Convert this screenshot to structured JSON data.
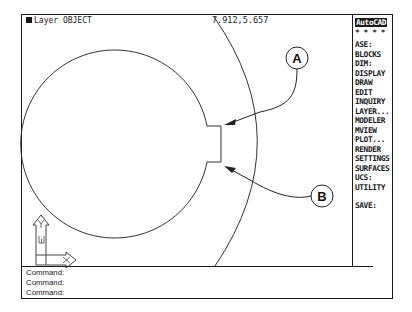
{
  "status_bar": {
    "layer_label": "Layer OBJECT",
    "coordinates": "7.912,5.657"
  },
  "side_menu": {
    "title": "AutoCAD",
    "separator": "* * * *",
    "items": [
      "ASE:",
      "BLOCKS",
      "DIM:",
      "DISPLAY",
      "DRAW",
      "EDIT",
      "INQUIRY",
      "LAYER...",
      "MODELER",
      "MVIEW",
      "PLOT...",
      "RENDER",
      "SETTINGS",
      "SURFACES",
      "UCS:",
      "UTILITY"
    ],
    "save": "SAVE:"
  },
  "callouts": {
    "a": "A",
    "b": "B"
  },
  "ucs_icon": {
    "x_label": "X",
    "y_label": "Y",
    "w_label": "W"
  },
  "command_area": {
    "lines": [
      "Command:",
      "Command:",
      "Command:"
    ]
  }
}
